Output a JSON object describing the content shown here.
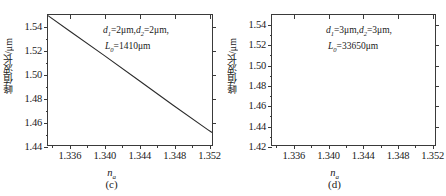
{
  "figure": {
    "panels": [
      {
        "id": "c",
        "caption": "(c)",
        "xlabel_main": "n",
        "xlabel_sub": "a",
        "ylabel": "峰值波长/μm",
        "annotation_line1": "d₁=2μm,d₂=2μm,",
        "annotation_line2": "L₀=1410μm",
        "annotation_d1": "d",
        "annotation_d1_sub": "1",
        "annotation_d1_val": "=2μm,",
        "annotation_d2": "d",
        "annotation_d2_sub": "2",
        "annotation_d2_val": "=2μm,",
        "annotation_L": "L",
        "annotation_L_sub": "0",
        "annotation_L_val": "=1410μm"
      },
      {
        "id": "d",
        "caption": "(d)",
        "xlabel_main": "n",
        "xlabel_sub": "a",
        "ylabel": "峰值波长/μm",
        "annotation_line1": "d₁=3μm,d₂=3μm,",
        "annotation_line2": "L₀=33650μm",
        "annotation_d1": "d",
        "annotation_d1_sub": "1",
        "annotation_d1_val": "=3μm,",
        "annotation_d2": "d",
        "annotation_d2_sub": "2",
        "annotation_d2_val": "=3μm,",
        "annotation_L": "L",
        "annotation_L_sub": "0",
        "annotation_L_val": "=33650μm"
      }
    ]
  },
  "chart_data": [
    {
      "type": "line",
      "panel": "(c)",
      "title": "",
      "xlabel": "n_a",
      "ylabel": "峰值波长/μm",
      "xlim": [
        1.3335,
        1.3525
      ],
      "ylim": [
        1.44,
        1.5495
      ],
      "xticks": [
        1.336,
        1.34,
        1.344,
        1.348,
        1.352
      ],
      "xtick_labels": [
        "1.336",
        "1.340",
        "1.344",
        "1.348",
        "1.352"
      ],
      "xminor_step": 0.002,
      "yticks": [
        1.44,
        1.46,
        1.48,
        1.5,
        1.52,
        1.54
      ],
      "ytick_labels": [
        "1.44",
        "1.46",
        "1.48",
        "1.50",
        "1.52",
        "1.54"
      ],
      "yminor_step": 0.01,
      "grid": false,
      "legend": null,
      "annotations": [
        "d1=2μm, d2=2μm,",
        "L0=1410μm"
      ],
      "series": [
        {
          "name": "peak wavelength vs n_a",
          "x": [
            1.3335,
            1.336,
            1.34,
            1.344,
            1.348,
            1.352,
            1.3525
          ],
          "y": [
            1.549,
            1.536,
            1.5155,
            1.4945,
            1.4735,
            1.453,
            1.4505
          ]
        }
      ]
    },
    {
      "type": "line",
      "panel": "(d)",
      "title": "",
      "xlabel": "n_a",
      "ylabel": "峰值波长/μm",
      "xlim": [
        1.3335,
        1.3525
      ],
      "ylim": [
        1.42,
        1.5495
      ],
      "xticks": [
        1.336,
        1.34,
        1.344,
        1.348,
        1.352
      ],
      "xtick_labels": [
        "1.336",
        "1.340",
        "1.344",
        "1.348",
        "1.352"
      ],
      "xminor_step": 0.002,
      "yticks": [
        1.42,
        1.44,
        1.46,
        1.48,
        1.5,
        1.52,
        1.54
      ],
      "ytick_labels": [
        "1.42",
        "1.44",
        "1.46",
        "1.48",
        "1.50",
        "1.52",
        "1.54"
      ],
      "yminor_step": 0.01,
      "grid": false,
      "legend": null,
      "annotations": [
        "d1=3μm, d2=3μm,",
        "L0=33650μm"
      ],
      "series": []
    }
  ]
}
